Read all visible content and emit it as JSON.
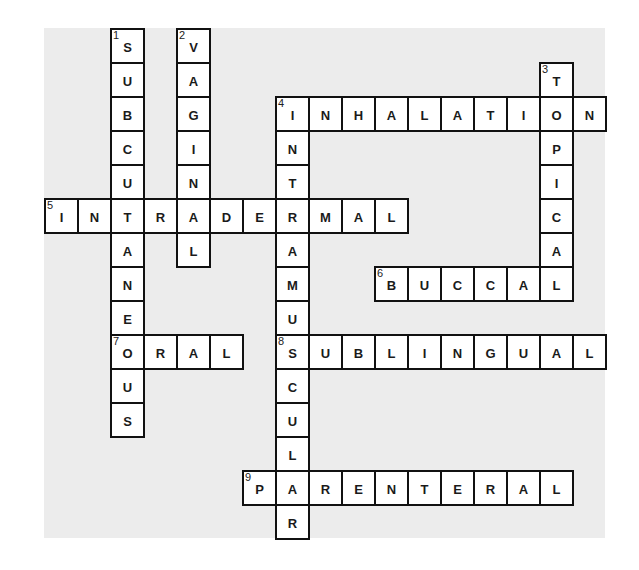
{
  "puzzle": {
    "type": "crossword",
    "grid": {
      "cols": 17,
      "rows": 15,
      "cell_w": 33,
      "cell_h": 34
    },
    "colors": {
      "background": "#ececec",
      "cell": "#ffffff",
      "border": "#111111",
      "text": "#1a1a1a"
    },
    "words": [
      {
        "number": 1,
        "direction": "down",
        "answer": "SUBCUTANEOUS",
        "col": 2,
        "row": 0
      },
      {
        "number": 2,
        "direction": "down",
        "answer": "VAGINAL",
        "col": 4,
        "row": 0
      },
      {
        "number": 3,
        "direction": "down",
        "answer": "TOPICAL",
        "col": 15,
        "row": 1
      },
      {
        "number": 4,
        "direction": "across",
        "answer": "INHALATION",
        "col": 7,
        "row": 2
      },
      {
        "number": 4,
        "direction": "down",
        "answer": "INTRAMUSCULAR",
        "col": 7,
        "row": 2
      },
      {
        "number": 5,
        "direction": "across",
        "answer": "INTRADERMAL",
        "col": 0,
        "row": 5
      },
      {
        "number": 6,
        "direction": "across",
        "answer": "BUCCAL",
        "col": 10,
        "row": 7
      },
      {
        "number": 7,
        "direction": "across",
        "answer": "ORAL",
        "col": 2,
        "row": 9
      },
      {
        "number": 8,
        "direction": "across",
        "answer": "SUBLINGUAL",
        "col": 7,
        "row": 9
      },
      {
        "number": 9,
        "direction": "across",
        "answer": "PARENTERAL",
        "col": 6,
        "row": 13
      }
    ]
  }
}
